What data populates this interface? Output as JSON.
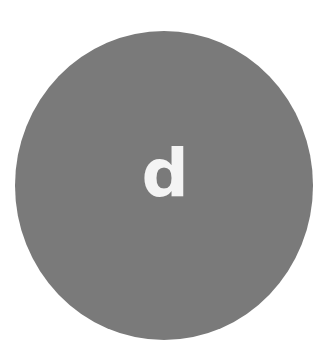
{
  "avatar": {
    "letter": "d",
    "background_color": "#7a7a7a",
    "letter_color": "#f4f4f4"
  },
  "page": {
    "background_color": "#ffffff"
  }
}
